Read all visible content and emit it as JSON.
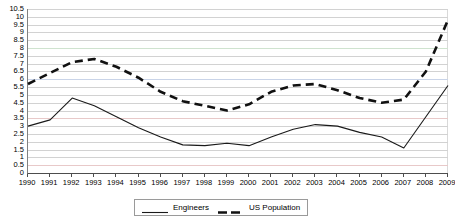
{
  "chart_data": {
    "type": "line",
    "title": "",
    "xlabel": "",
    "ylabel": "",
    "grid": true,
    "legend_position": "bottom",
    "ylim": [
      0,
      10.5
    ],
    "y_tick_step": 0.5,
    "y_ticks": [
      "0",
      "0.5",
      "1",
      "1.5",
      "2",
      "2.5",
      "3",
      "3.5",
      "4",
      "4.5",
      "5",
      "5.5",
      "6",
      "6.5",
      "7",
      "7.5",
      "8",
      "8.5",
      "9",
      "9.5",
      "10",
      "10.5"
    ],
    "categories": [
      "1990",
      "1991",
      "1992",
      "1993",
      "1994",
      "1995",
      "1996",
      "1997",
      "1998",
      "1999",
      "2000",
      "2001",
      "2002",
      "2003",
      "2004",
      "2005",
      "2006",
      "2007",
      "2008",
      "2009"
    ],
    "series": [
      {
        "name": "Engineers",
        "style": "solid",
        "color": "#1a1a1a",
        "values": [
          3.0,
          3.4,
          4.8,
          4.3,
          3.6,
          2.9,
          2.3,
          1.8,
          1.75,
          1.9,
          1.75,
          2.3,
          2.8,
          3.1,
          3.0,
          2.6,
          2.3,
          1.6,
          3.6,
          5.6
        ]
      },
      {
        "name": "US Population",
        "style": "dashed",
        "color": "#111111",
        "values": [
          5.7,
          6.4,
          7.1,
          7.3,
          6.8,
          6.1,
          5.2,
          4.6,
          4.3,
          4.0,
          4.4,
          5.2,
          5.6,
          5.7,
          5.3,
          4.8,
          4.5,
          4.7,
          6.5,
          9.8
        ]
      }
    ]
  },
  "legend": {
    "entries": [
      {
        "label": "Engineers",
        "style": "solid"
      },
      {
        "label": "US Population",
        "style": "dashed"
      }
    ]
  },
  "colors": {
    "gridline": "#d2d2d2",
    "axis": "#4d4d4d",
    "series_engineers": "#1a1a1a",
    "series_population": "#111111",
    "legend_border": "#9a9a9a"
  }
}
